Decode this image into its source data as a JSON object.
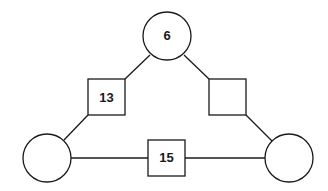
{
  "nodes": {
    "top_circle": {
      "label": "6"
    },
    "left_square": {
      "label": "13"
    },
    "right_square": {
      "label": ""
    },
    "bottom_square": {
      "label": "15"
    },
    "left_circle": {
      "label": ""
    },
    "right_circle": {
      "label": ""
    }
  },
  "colors": {
    "stroke": "#1a1a1a",
    "fill": "#ffffff"
  }
}
